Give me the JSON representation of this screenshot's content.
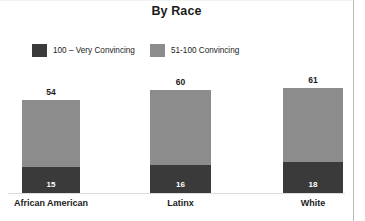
{
  "chart_data": {
    "type": "bar",
    "title": "By Race",
    "subtitle": "",
    "xlabel": "",
    "ylabel": "",
    "stacked": true,
    "grid": false,
    "legend_position": "top-left",
    "ylim": [
      0,
      75
    ],
    "categories": [
      "African American",
      "Latinx",
      "White"
    ],
    "series": [
      {
        "name": "100 – Very Convincing",
        "color": "#3a3a3a",
        "values": [
          15,
          16,
          18
        ]
      },
      {
        "name": "51-100 Convincing",
        "color": "#8c8c8c",
        "values": [
          54,
          60,
          61
        ]
      }
    ],
    "total_labels": [
      "54",
      "60",
      "61"
    ],
    "inner_labels": [
      "15",
      "16",
      "18"
    ]
  },
  "legend": {
    "items": [
      {
        "label": "100 – Very Convincing",
        "color": "#3a3a3a"
      },
      {
        "label": "51-100 Convincing",
        "color": "#8c8c8c"
      }
    ]
  },
  "colors": {
    "dark_segment": "#3a3a3a",
    "gray_segment": "#8c8c8c",
    "text": "#1b1b1b",
    "frame": "#b9b9b9",
    "axis": "#dcdcdc",
    "background": "#ffffff"
  }
}
